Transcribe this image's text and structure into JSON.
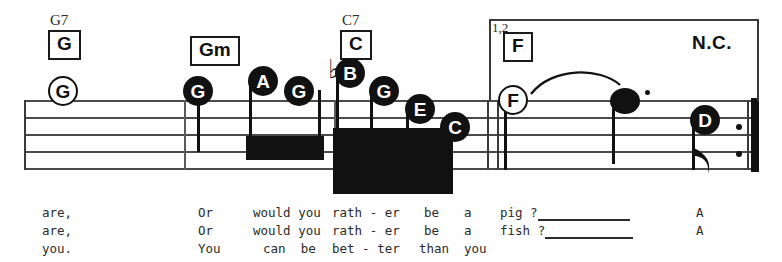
{
  "sheet": {
    "type": "music-notation-staff",
    "staff_lines": 5,
    "clef": "none-shown"
  },
  "chords": [
    {
      "id": "chord-g",
      "superscript": "G7",
      "label": "G",
      "boxed": true,
      "x": 48,
      "y": 28
    },
    {
      "id": "chord-gm",
      "superscript": "",
      "label": "Gm",
      "boxed": true,
      "x": 190,
      "y": 36
    },
    {
      "id": "chord-c",
      "superscript": "C7",
      "label": "C",
      "boxed": true,
      "x": 340,
      "y": 28
    },
    {
      "id": "chord-f",
      "superscript": "",
      "label": "F",
      "boxed": true,
      "x": 503,
      "y": 30
    },
    {
      "id": "chord-nc",
      "superscript": "",
      "label": "N.C.",
      "boxed": false,
      "x": 692,
      "y": 32
    }
  ],
  "volta": {
    "label": "1,2",
    "start_x": 489,
    "end_x": 759,
    "top_y": 19
  },
  "notes": [
    {
      "id": "note-1",
      "letter": "G",
      "head": "open",
      "x": 62,
      "y": 76,
      "duration": "whole"
    },
    {
      "id": "note-2",
      "letter": "G",
      "head": "filled",
      "x": 197,
      "y": 76,
      "duration": "quarter"
    },
    {
      "id": "note-3",
      "letter": "A",
      "head": "filled",
      "x": 262,
      "y": 66,
      "duration": "eighth"
    },
    {
      "id": "note-4",
      "letter": "G",
      "head": "filled",
      "x": 298,
      "y": 76,
      "duration": "eighth"
    },
    {
      "id": "note-5",
      "letter": "B",
      "head": "filled",
      "x": 347,
      "y": 58,
      "duration": "eighth",
      "accidental": "flat"
    },
    {
      "id": "note-6",
      "letter": "G",
      "head": "filled",
      "x": 381,
      "y": 76,
      "duration": "eighth"
    },
    {
      "id": "note-7",
      "letter": "E",
      "head": "filled",
      "x": 419,
      "y": 95,
      "duration": "eighth"
    },
    {
      "id": "note-8",
      "letter": "C",
      "head": "filled",
      "x": 453,
      "y": 113,
      "duration": "eighth"
    },
    {
      "id": "note-9",
      "letter": "F",
      "head": "open",
      "x": 506,
      "y": 85,
      "duration": "half"
    },
    {
      "id": "note-10",
      "letter": "",
      "head": "plain",
      "x": 612,
      "y": 88,
      "duration": "dotted",
      "dotted": true
    },
    {
      "id": "note-11",
      "letter": "D",
      "head": "filled",
      "x": 692,
      "y": 105,
      "duration": "eighth"
    }
  ],
  "lyrics": {
    "rows": [
      {
        "verse": "1",
        "words": [
          {
            "text": "are,",
            "x": 42
          },
          {
            "text": "Or",
            "x": 198
          },
          {
            "text": "would you",
            "x": 253
          },
          {
            "text": "rath - er",
            "x": 332
          },
          {
            "text": "be",
            "x": 424
          },
          {
            "text": "a",
            "x": 464
          },
          {
            "text": "pig ?",
            "x": 500
          },
          {
            "text": "A",
            "x": 696
          }
        ],
        "extension": {
          "x": 538,
          "width": 92
        }
      },
      {
        "verse": "2",
        "words": [
          {
            "text": "are,",
            "x": 42
          },
          {
            "text": "Or",
            "x": 198
          },
          {
            "text": "would you",
            "x": 253
          },
          {
            "text": "rath - er",
            "x": 332
          },
          {
            "text": "be",
            "x": 424
          },
          {
            "text": "a",
            "x": 464
          },
          {
            "text": "fish ?",
            "x": 500
          },
          {
            "text": "A",
            "x": 696
          }
        ],
        "extension": {
          "x": 545,
          "width": 88
        }
      },
      {
        "verse": "3",
        "words": [
          {
            "text": "you.",
            "x": 42
          },
          {
            "text": "You",
            "x": 198
          },
          {
            "text": "can  be",
            "x": 263
          },
          {
            "text": "bet - ter",
            "x": 332
          },
          {
            "text": "than",
            "x": 419
          },
          {
            "text": "you",
            "x": 464
          }
        ],
        "extension": null
      }
    ]
  },
  "colors": {
    "ink": "#111111",
    "staff": "#4a4a4a",
    "lyric": "#2b2b2b",
    "paper": "#fefefe"
  }
}
